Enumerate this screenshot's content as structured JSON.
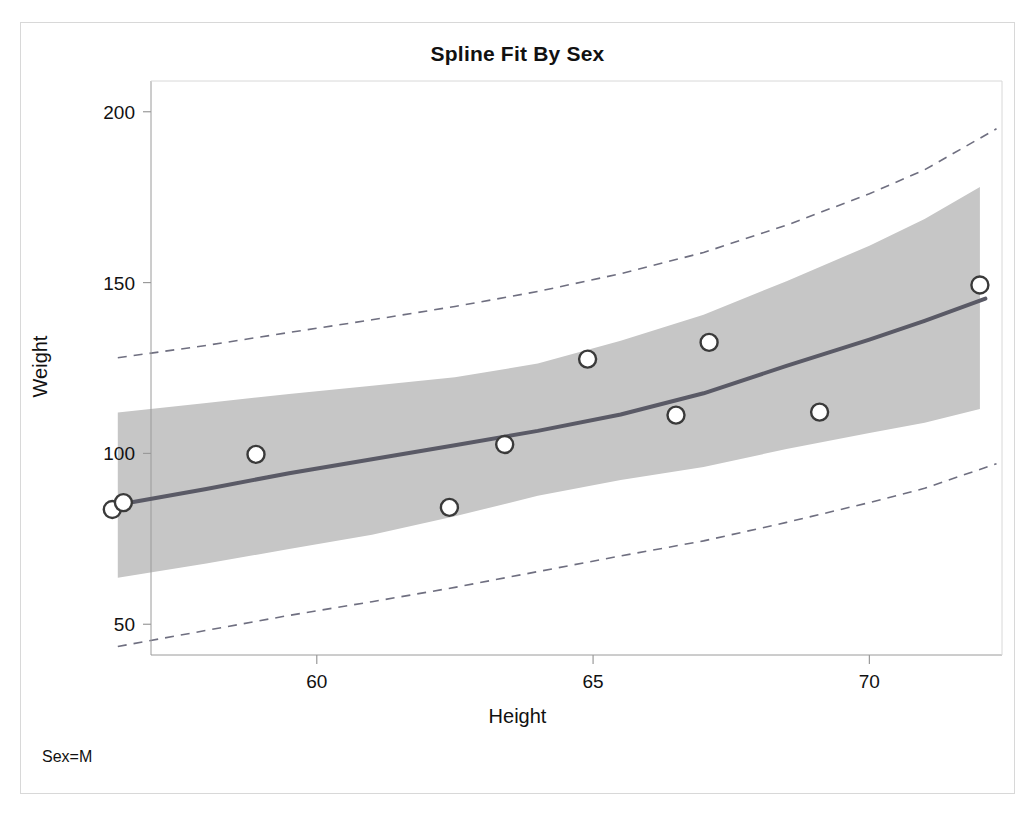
{
  "chart_data": {
    "type": "scatter",
    "title": "Spline Fit By Sex",
    "xlabel": "Height",
    "ylabel": "Weight",
    "annotation": "Sex=M",
    "xlim": [
      57.0,
      72.4
    ],
    "ylim": [
      41.0,
      209.0
    ],
    "xticks": [
      60,
      65,
      70
    ],
    "xtick_labels": [
      "60",
      "65",
      "70"
    ],
    "yticks": [
      50,
      100,
      150,
      200
    ],
    "ytick_labels": [
      "50",
      "100",
      "150",
      "200"
    ],
    "grid": false,
    "legend": "none",
    "colors": {
      "marker_edge": "#3a3a3a",
      "fit_line": "#5a5a66",
      "ci_band": "#c6c6c6",
      "prediction_limits": "#6f6f80",
      "axis": "#9a9a9a",
      "frame": "#d8d8d8",
      "text": "#111111"
    },
    "series": [
      {
        "name": "Observations",
        "type": "scatter",
        "marker": "open-circle",
        "x": [
          56.3,
          56.5,
          58.9,
          62.4,
          63.4,
          64.9,
          66.5,
          67.1,
          69.1,
          72.0
        ],
        "y": [
          83.6,
          85.6,
          99.7,
          84.2,
          102.6,
          127.6,
          111.2,
          132.5,
          112.1,
          149.3
        ]
      },
      {
        "name": "Spline Fit",
        "type": "line",
        "x": [
          56.4,
          58.0,
          59.5,
          61.0,
          62.5,
          64.0,
          65.5,
          67.0,
          68.5,
          70.0,
          71.0,
          72.1
        ],
        "y": [
          85.0,
          89.6,
          94.2,
          98.3,
          102.4,
          106.6,
          111.4,
          117.6,
          125.6,
          133.3,
          138.8,
          145.3
        ]
      },
      {
        "name": "95% Confidence Band Upper",
        "type": "band-edge",
        "x": [
          56.4,
          58.0,
          59.5,
          61.0,
          62.5,
          64.0,
          65.5,
          67.0,
          68.5,
          70.0,
          71.0,
          72.0
        ],
        "y": [
          112.0,
          114.8,
          117.4,
          119.8,
          122.3,
          126.3,
          133.0,
          140.6,
          150.4,
          160.8,
          168.6,
          178.0
        ]
      },
      {
        "name": "95% Confidence Band Lower",
        "type": "band-edge",
        "x": [
          56.4,
          58.0,
          59.5,
          61.0,
          62.5,
          64.0,
          65.5,
          67.0,
          68.5,
          70.0,
          71.0,
          72.0
        ],
        "y": [
          63.6,
          67.8,
          72.0,
          76.2,
          81.6,
          87.6,
          92.2,
          96.0,
          101.3,
          106.0,
          109.0,
          113.0
        ]
      },
      {
        "name": "Upper Prediction Limit",
        "type": "dashed-line",
        "x": [
          56.4,
          58.0,
          59.5,
          61.0,
          62.5,
          64.0,
          65.5,
          67.0,
          68.5,
          70.0,
          71.0,
          72.3
        ],
        "y": [
          128.0,
          131.6,
          135.4,
          139.1,
          143.0,
          147.4,
          152.6,
          158.8,
          166.8,
          176.0,
          183.0,
          195.0
        ]
      },
      {
        "name": "Lower Prediction Limit",
        "type": "dashed-line",
        "x": [
          56.4,
          58.0,
          59.5,
          61.0,
          62.5,
          64.0,
          65.5,
          67.0,
          68.5,
          70.0,
          71.0,
          72.3
        ],
        "y": [
          43.5,
          48.2,
          52.6,
          56.6,
          60.8,
          65.4,
          70.0,
          74.4,
          79.8,
          85.6,
          89.8,
          97.0
        ]
      }
    ]
  },
  "title": "Spline Fit By Sex",
  "xlabel": "Height",
  "ylabel": "Weight",
  "footnote": "Sex=M"
}
